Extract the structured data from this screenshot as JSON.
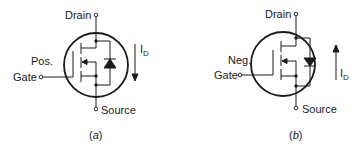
{
  "figure": {
    "panels": [
      {
        "id": "a",
        "caption_open": "(",
        "caption_letter": "a",
        "caption_close": ")",
        "drain_label": "Drain",
        "source_label": "Source",
        "gate_label": "Gate",
        "gate_polarity": "Pos.",
        "current_label_main": "I",
        "current_label_sub": "D",
        "current_direction": "down"
      },
      {
        "id": "b",
        "caption_open": "(",
        "caption_letter": "b",
        "caption_close": ")",
        "drain_label": "Drain",
        "source_label": "Source",
        "gate_label": "Gate",
        "gate_polarity": "Neg.",
        "current_label_main": "I",
        "current_label_sub": "D",
        "current_direction": "up"
      }
    ]
  }
}
